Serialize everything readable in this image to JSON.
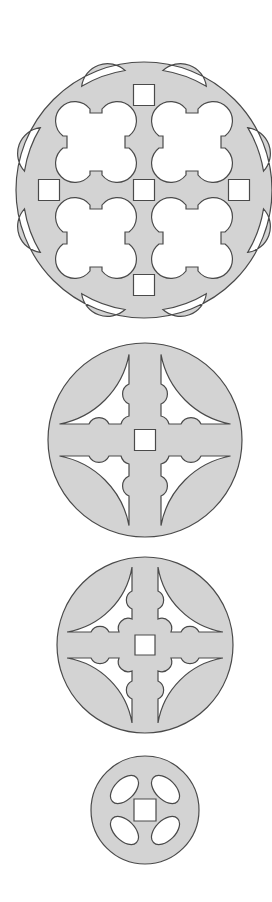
{
  "figure": {
    "colors": {
      "fill": "#d3d3d3",
      "stroke": "#4a4a4a",
      "background": "#ffffff"
    },
    "discs": [
      {
        "id": "disc-1",
        "cx": 144,
        "cy": 190,
        "r": 128,
        "pattern": "four quatrefoil cutouts, five square holes, eight lens-shaped rim slots"
      },
      {
        "id": "disc-2",
        "cx": 145,
        "cy": 440,
        "r": 97,
        "pattern": "cross with four lobed openings, central square hole"
      },
      {
        "id": "disc-3",
        "cx": 145,
        "cy": 645,
        "r": 88,
        "pattern": "cross with notched arms, four lobed openings, central square hole"
      },
      {
        "id": "disc-4",
        "cx": 145,
        "cy": 810,
        "r": 54,
        "pattern": "four oval openings, central square hole"
      }
    ]
  }
}
